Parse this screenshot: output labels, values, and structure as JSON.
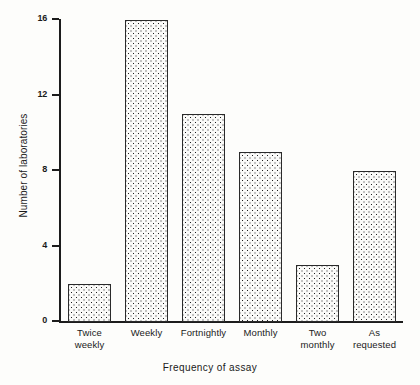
{
  "chart_data": {
    "type": "bar",
    "title": "",
    "xlabel": "Frequency of assay",
    "ylabel": "Number of laboratories",
    "categories": [
      "Twice weekly",
      "Weekly",
      "Fortnightly",
      "Monthly",
      "Two monthly",
      "As requested"
    ],
    "category_lines": [
      [
        "Twice",
        "weekly"
      ],
      [
        "Weekly"
      ],
      [
        "Fortnightly"
      ],
      [
        "Monthly"
      ],
      [
        "Two",
        "monthly"
      ],
      [
        "As",
        "requested"
      ]
    ],
    "values": [
      2,
      16,
      11,
      9,
      3,
      8
    ],
    "ylim": [
      0,
      16
    ],
    "yticks": [
      0,
      4,
      8,
      12,
      16
    ],
    "ytick_labels": [
      "0",
      "4",
      "8",
      "12",
      "16"
    ],
    "grid": false,
    "legend": false,
    "bar_fill": "black-dot-stipple",
    "bar_edge_color": "#2a2a2a",
    "background_color": "#fdfdfb",
    "axis_color": "#1c1c1c"
  }
}
